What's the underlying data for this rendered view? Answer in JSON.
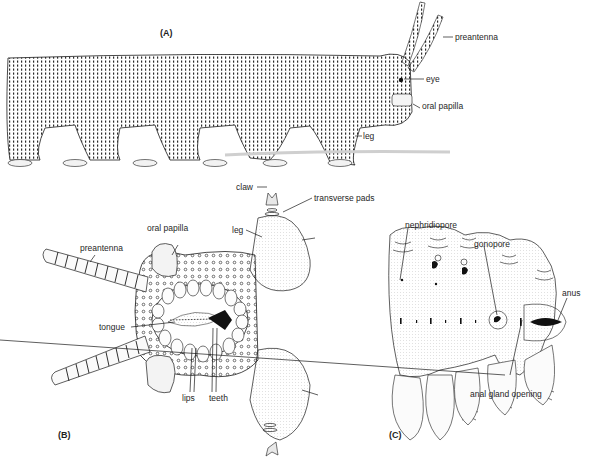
{
  "figure": {
    "panels": [
      {
        "id": "A",
        "label": "(A)",
        "view": "lateral view of whole animal",
        "annotations": [
          {
            "text": "preantenna"
          },
          {
            "text": "eye"
          },
          {
            "text": "oral papilla"
          },
          {
            "text": "leg"
          }
        ]
      },
      {
        "id": "B",
        "label": "(B)",
        "view": "ventral view of head",
        "annotations": [
          {
            "text": "claw"
          },
          {
            "text": "transverse pads"
          },
          {
            "text": "leg"
          },
          {
            "text": "oral papilla"
          },
          {
            "text": "preantenna"
          },
          {
            "text": "tongue"
          },
          {
            "text": "lips"
          },
          {
            "text": "teeth"
          }
        ]
      },
      {
        "id": "C",
        "label": "(C)",
        "view": "ventral view of posterior body",
        "annotations": [
          {
            "text": "nephridiopore"
          },
          {
            "text": "gonopore"
          },
          {
            "text": "anus"
          },
          {
            "text": "anal gland opening"
          }
        ]
      }
    ]
  },
  "colors": {
    "ink": "#1a1a1a",
    "stipple": "#2b2b2b",
    "background": "#ffffff",
    "shade": "#d9d9d9"
  }
}
